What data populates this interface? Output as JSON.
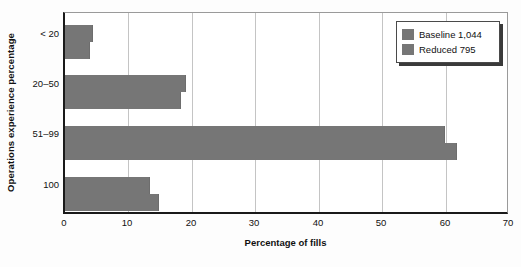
{
  "chart_data": {
    "type": "bar",
    "orientation": "horizontal",
    "title": "",
    "xlabel": "Percentage of fills",
    "ylabel": "Operations experience percentage",
    "categories": [
      "< 20",
      "20–50",
      "51–99",
      "100"
    ],
    "series": [
      {
        "name": "Baseline 1,044",
        "values": [
          4.5,
          19.3,
          60.4,
          13.6
        ],
        "color": "#767676"
      },
      {
        "name": "Reduced 795",
        "values": [
          3.9,
          18.5,
          62.4,
          14.9
        ],
        "color": "#767676"
      }
    ],
    "xlim": [
      0,
      70
    ],
    "xticks": [
      "0",
      "10",
      "20",
      "30",
      "40",
      "50",
      "60",
      "70"
    ],
    "xtick_values": [
      0,
      10,
      20,
      30,
      40,
      50,
      60,
      70
    ],
    "grid": "vertical",
    "legend_position": "top-right",
    "legend_entries": [
      "Baseline 1,044",
      "Reduced 795"
    ]
  },
  "axis": {
    "y_title": "Operations experience percentage",
    "x_title": "Percentage of fills"
  },
  "colors": {
    "bar": "#767676",
    "axis": "#1a1a1a",
    "gridline": "#c4c4c4",
    "background": "#ffffff"
  }
}
